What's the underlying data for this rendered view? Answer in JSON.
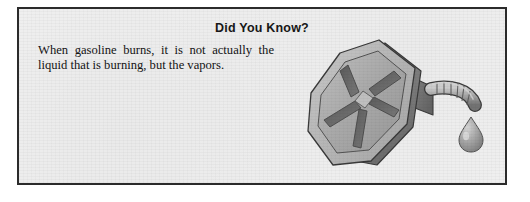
{
  "panel": {
    "heading": "Did You Know?",
    "body": "When gasoline burns, it is not actually the liquid that is burning, but the vapors.",
    "border_color": "#2b2b2b",
    "background_color": "#f1f1f1",
    "text_color": "#141414"
  },
  "illustration": {
    "name": "gasoline-can",
    "description": "Three-dimensional gray metal gasoline can tilted on its side with an X-shaped cross brace on the front face, a ribbed flexible pour spout on the right side, and a single drop of fuel dripping from the spout tip.",
    "parts": {
      "body": "can-body",
      "front_face": "can-front-face",
      "cross_brace": "can-x-brace",
      "hub": "can-center-hub",
      "spout": "can-flexible-spout",
      "drip": "fuel-drip"
    },
    "colors": {
      "face_light": "#b4b4b4",
      "face_mid": "#a0a0a0",
      "side_dark": "#7d7d7d",
      "channel_shadow": "#616161",
      "outline": "#3a3a3a",
      "highlight": "#d2d2d2",
      "drip": "#9c9c9c"
    }
  }
}
